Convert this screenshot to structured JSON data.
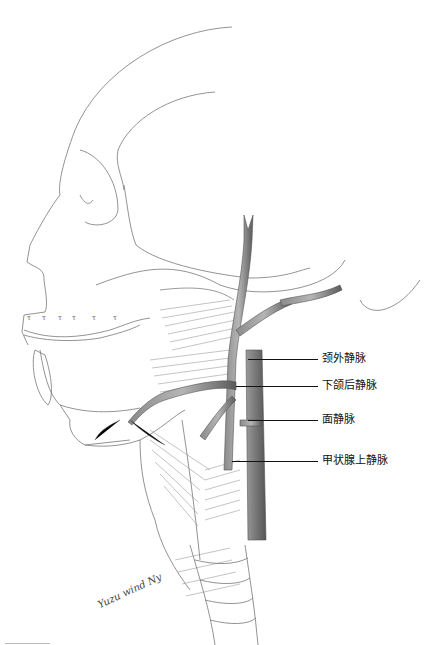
{
  "figure": {
    "labels": [
      {
        "id": "external-jugular-vein",
        "text": "颈外静脉",
        "x": 322,
        "y": 353,
        "lineFrom": 248,
        "lineTo": 318,
        "lineY": 359
      },
      {
        "id": "retromandibular-vein",
        "text": "下颌后静脉",
        "x": 322,
        "y": 380,
        "lineFrom": 236,
        "lineTo": 318,
        "lineY": 386
      },
      {
        "id": "facial-vein",
        "text": "面静脉",
        "x": 322,
        "y": 414,
        "lineFrom": 248,
        "lineTo": 318,
        "lineY": 420
      },
      {
        "id": "superior-thyroid-vein",
        "text": "甲状腺上静脉",
        "x": 322,
        "y": 455,
        "lineFrom": 232,
        "lineTo": 318,
        "lineY": 461
      }
    ],
    "signature": "Yuzu wind Ny",
    "colors": {
      "line": "#555555",
      "vein": "#6e6e6e",
      "veinLight": "#9a9a9a",
      "text": "#111111"
    }
  }
}
